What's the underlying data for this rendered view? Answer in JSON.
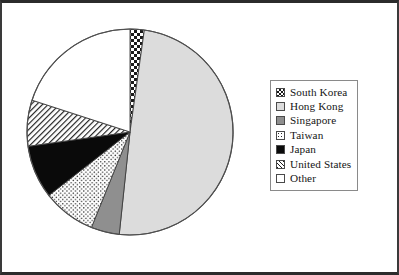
{
  "chart_data": {
    "type": "pie",
    "title": "",
    "legend_position": "right",
    "start_angle_deg": 0,
    "direction": "clockwise",
    "categories": [
      "South Korea",
      "Hong Kong",
      "Singapore",
      "Taiwan",
      "Japan",
      "United States",
      "Other"
    ],
    "values": [
      2.2,
      49.4,
      4.4,
      8.3,
      8.3,
      7.2,
      20.2
    ],
    "unit": "percent",
    "slices": [
      {
        "label": "South Korea",
        "value": 2.2,
        "start_deg": 0.0,
        "end_deg": 8.0,
        "pattern": "checkerboard",
        "fill": "#ffffff",
        "ink": "#1a1a1a"
      },
      {
        "label": "Hong Kong",
        "value": 49.4,
        "start_deg": 8.0,
        "end_deg": 186.0,
        "pattern": "solid-light-gray",
        "fill": "#dcdcdc",
        "ink": "#dcdcdc"
      },
      {
        "label": "Singapore",
        "value": 4.4,
        "start_deg": 186.0,
        "end_deg": 202.0,
        "pattern": "solid-mid-gray",
        "fill": "#8f8f8f",
        "ink": "#8f8f8f"
      },
      {
        "label": "Taiwan",
        "value": 8.3,
        "start_deg": 202.0,
        "end_deg": 232.0,
        "pattern": "fine-dots",
        "fill": "#ffffff",
        "ink": "#2a2a2a"
      },
      {
        "label": "Japan",
        "value": 8.3,
        "start_deg": 232.0,
        "end_deg": 262.0,
        "pattern": "solid-black",
        "fill": "#0a0a0a",
        "ink": "#0a0a0a"
      },
      {
        "label": "United States",
        "value": 7.2,
        "start_deg": 262.0,
        "end_deg": 288.0,
        "pattern": "diagonal-hatch",
        "fill": "#ffffff",
        "ink": "#1f1f1f"
      },
      {
        "label": "Other",
        "value": 20.2,
        "start_deg": 288.0,
        "end_deg": 360.0,
        "pattern": "solid-white",
        "fill": "#ffffff",
        "ink": "#ffffff"
      }
    ]
  },
  "legend": {
    "items": [
      {
        "label": "South Korea",
        "swatch_class": "sw-checker",
        "swatch_name": "legend-swatch-south-korea"
      },
      {
        "label": "Hong Kong",
        "swatch_class": "sw-lightgray",
        "swatch_name": "legend-swatch-hong-kong"
      },
      {
        "label": "Singapore",
        "swatch_class": "sw-midgray",
        "swatch_name": "legend-swatch-singapore"
      },
      {
        "label": "Taiwan",
        "swatch_class": "sw-dots",
        "swatch_name": "legend-swatch-taiwan"
      },
      {
        "label": "Japan",
        "swatch_class": "sw-black",
        "swatch_name": "legend-swatch-japan"
      },
      {
        "label": "United States",
        "swatch_class": "sw-hatch",
        "swatch_name": "legend-swatch-united-states"
      },
      {
        "label": "Other",
        "swatch_class": "sw-plain-white",
        "swatch_name": "legend-swatch-other"
      }
    ]
  },
  "geometry": {
    "center_x": 104,
    "center_y": 108,
    "radius": 103,
    "outline_color": "#4f4f4f"
  }
}
